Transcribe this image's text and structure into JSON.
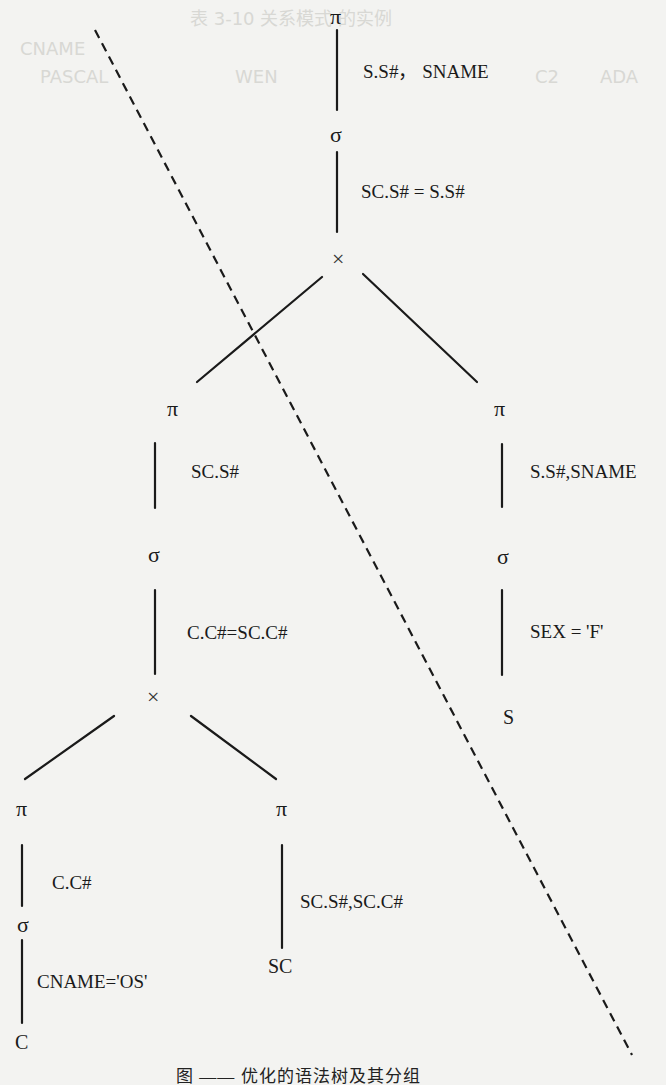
{
  "figure": {
    "caption": "图 —— 优化的语法树及其分组",
    "colors": {
      "background": "#f3f3f1",
      "ink": "#1a1a1a",
      "ghost_text": "#d8d8d4"
    }
  },
  "tree": {
    "root_project": {
      "op": "π",
      "attrs": "S.S#， SNAME"
    },
    "root_select": {
      "op": "σ",
      "cond": "SC.S# = S.S#"
    },
    "root_join": {
      "op": "×"
    },
    "left_project": {
      "op": "π",
      "attrs": "SC.S#"
    },
    "left_select": {
      "op": "σ",
      "cond": "C.C#=SC.C#"
    },
    "left_join": {
      "op": "×"
    },
    "ll_project": {
      "op": "π",
      "attrs": "C.C#"
    },
    "ll_select": {
      "op": "σ",
      "cond": "CNAME='OS'"
    },
    "ll_relation": {
      "name": "C"
    },
    "lr_project": {
      "op": "π",
      "attrs": "SC.S#,SC.C#"
    },
    "lr_relation": {
      "name": "SC"
    },
    "right_project": {
      "op": "π",
      "attrs": "S.S#,SNAME"
    },
    "right_select": {
      "op": "σ",
      "cond": "SEX = 'F'"
    },
    "right_relation": {
      "name": "S"
    }
  },
  "grouping_line": {
    "style": "dashed",
    "from": [
      95,
      30
    ],
    "to": [
      632,
      1055
    ]
  },
  "background_bleed": {
    "header": "表 3-10 关系模式 的实例",
    "lines": [
      "CNAME",
      "PASCAL",
      "WEN",
      "C2",
      "ADA"
    ]
  }
}
